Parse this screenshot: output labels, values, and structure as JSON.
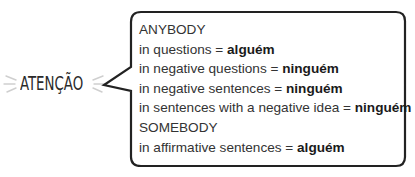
{
  "label": {
    "text": "ATENÇÃO",
    "icon": "sparkle-rays-icon"
  },
  "callout": {
    "shape": "speech-bubble",
    "border_color": "#222222",
    "lines": [
      {
        "prefix": "ANYBODY",
        "bold": ""
      },
      {
        "prefix": "in questions = ",
        "bold": "alguém"
      },
      {
        "prefix": "in negative questions = ",
        "bold": "ninguém"
      },
      {
        "prefix": "in negative sentences = ",
        "bold": "ninguém"
      },
      {
        "prefix": "in sentences with a negative idea = ",
        "bold": "ninguém"
      },
      {
        "prefix": "SOMEBODY",
        "bold": ""
      },
      {
        "prefix": "in affirmative sentences = ",
        "bold": "alguém"
      }
    ]
  }
}
